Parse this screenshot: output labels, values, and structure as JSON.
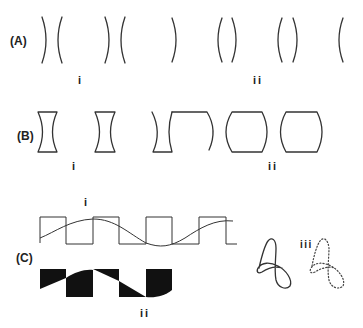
{
  "figure": {
    "panels": [
      {
        "id": "A",
        "label": "(A)",
        "sublabels": [
          "i",
          "ii"
        ],
        "description": "Pairs of curved arc lines (lens surfaces)"
      },
      {
        "id": "B",
        "label": "(B)",
        "sublabels": [
          "i",
          "ii"
        ],
        "description": "Concave and convex lens shapes"
      },
      {
        "id": "C",
        "label": "(C)",
        "sublabels": [
          "i",
          "ii",
          "iii"
        ],
        "description": "Square wave with sine overlay, filled difference shapes, and loop curves (solid and dotted)"
      }
    ]
  },
  "labels": {
    "A": "(A)",
    "B": "(B)",
    "C": "(C)",
    "A_i": "i",
    "A_ii": "ii",
    "B_i": "i",
    "B_ii": "ii",
    "C_i": "i",
    "C_ii": "ii",
    "C_iii": "iii"
  },
  "colors": {
    "ink": "#333333",
    "fill": "#111111",
    "background": "#ffffff"
  }
}
